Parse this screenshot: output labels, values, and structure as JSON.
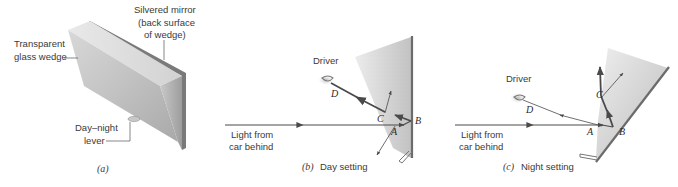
{
  "figure": {
    "panel_a": {
      "caption": "(a)",
      "labels": {
        "wedge_line1": "Transparent",
        "wedge_line2": "glass wedge",
        "mirror_line1": "Silvered mirror",
        "mirror_line2": "(back surface",
        "mirror_line3": "of wedge)",
        "lever_line1": "Day–night",
        "lever_line2": "lever"
      }
    },
    "panel_b": {
      "caption_letter": "(b)",
      "caption_text": "Day setting",
      "driver": "Driver",
      "light_line1": "Light from",
      "light_line2": "car behind",
      "points": {
        "A": "A",
        "B": "B",
        "C": "C",
        "D": "D"
      }
    },
    "panel_c": {
      "caption_letter": "(c)",
      "caption_text": "Night setting",
      "driver": "Driver",
      "light_line1": "Light from",
      "light_line2": "car behind",
      "points": {
        "A": "A",
        "B": "B",
        "C": "C",
        "D": "D"
      }
    },
    "colors": {
      "ray": "#4a4a4a",
      "mirror": "#6b6b6b",
      "glass_light": "#e6e6e6",
      "glass_dark": "#b4b4b4",
      "text": "#3a3a3a"
    }
  }
}
